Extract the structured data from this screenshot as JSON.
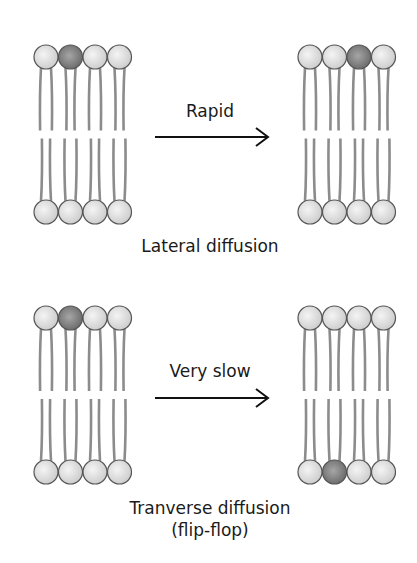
{
  "panels": [
    {
      "id": "lateral",
      "arrow_label": "Rapid",
      "caption": "Lateral diffusion",
      "before": {
        "top_highlight": 1,
        "bottom_highlight": -1
      },
      "after": {
        "top_highlight": 2,
        "bottom_highlight": -1
      }
    },
    {
      "id": "transverse",
      "arrow_label": "Very slow",
      "caption_line1": "Tranverse diffusion",
      "caption_line2": "(flip-flop)",
      "before": {
        "top_highlight": 1,
        "bottom_highlight": -1
      },
      "after": {
        "top_highlight": -1,
        "bottom_highlight": 1
      }
    }
  ],
  "colors": {
    "head_light": "#e2e2e2",
    "head_dark": "#8a8a8a",
    "head_outline": "#555555",
    "tail": "#8c8c8c",
    "arrow": "#111111"
  }
}
